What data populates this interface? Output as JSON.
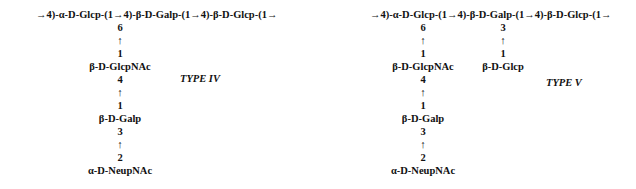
{
  "structures": [
    {
      "id": "type-iv",
      "label": "TYPE IV",
      "backbone": "→4)-α-D-Glcp-(1→4)-β-D-Galp-(1→4)-β-D-Glcp-(1→",
      "branches": [
        {
          "attached_to": "α-D-Glcp",
          "chain": [
            {
              "position": "6",
              "arrow": "↑",
              "anomeric": "1",
              "residue": "β-D-GlcpNAc"
            },
            {
              "position": "4",
              "arrow": "↑",
              "anomeric": "1",
              "residue": "β-D-Galp"
            },
            {
              "position": "3",
              "arrow": "↑",
              "anomeric": "2",
              "residue": "α-D-NeupNAc"
            }
          ]
        }
      ]
    },
    {
      "id": "type-v",
      "label": "TYPE V",
      "backbone": "→4)-α-D-Glcp-(1→4)-β-D-Galp-(1→4)-β-D-Glcp-(1→",
      "branches": [
        {
          "attached_to": "α-D-Glcp",
          "chain": [
            {
              "position": "6",
              "arrow": "↑",
              "anomeric": "1",
              "residue": "β-D-GlcpNAc"
            },
            {
              "position": "4",
              "arrow": "↑",
              "anomeric": "1",
              "residue": "β-D-Galp"
            },
            {
              "position": "3",
              "arrow": "↑",
              "anomeric": "2",
              "residue": "α-D-NeupNAc"
            }
          ]
        },
        {
          "attached_to": "β-D-Galp",
          "chain": [
            {
              "position": "3",
              "arrow": "↑",
              "anomeric": "1",
              "residue": "β-D-Glcp"
            }
          ]
        }
      ]
    }
  ]
}
